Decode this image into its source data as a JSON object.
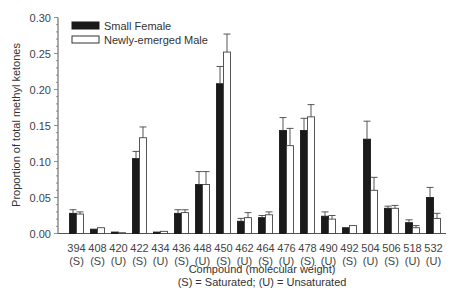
{
  "chart_data": {
    "type": "bar",
    "title": "",
    "xlabel": "Compound (molecular weight)",
    "xlabel_note": "(S) = Saturated; (U) = Unsaturated",
    "ylabel": "Proportion of total methyl ketones",
    "ylim": [
      0,
      0.3
    ],
    "yticks": [
      "0.00",
      "0.05",
      "0.10",
      "0.15",
      "0.20",
      "0.25",
      "0.30"
    ],
    "grid": false,
    "legend_position": "top-left",
    "categories": [
      "394",
      "408",
      "420",
      "422",
      "434",
      "436",
      "448",
      "450",
      "462",
      "464",
      "476",
      "478",
      "490",
      "492",
      "504",
      "506",
      "518",
      "532"
    ],
    "category_types": [
      "(S)",
      "(S)",
      "(U)",
      "(S)",
      "(U)",
      "(S)",
      "(U)",
      "(S)",
      "(U)",
      "(S)",
      "(U)",
      "(S)",
      "(U)",
      "(S)",
      "(U)",
      "(S)",
      "(U)",
      "(U)"
    ],
    "series": [
      {
        "name": "Small Female",
        "fill": "#1a1a1a",
        "values": [
          0.028,
          0.006,
          0.002,
          0.104,
          0.002,
          0.028,
          0.068,
          0.208,
          0.017,
          0.022,
          0.143,
          0.143,
          0.024,
          0.008,
          0.131,
          0.035,
          0.015,
          0.05
        ],
        "errors": [
          0.005,
          0.001,
          0.0,
          0.01,
          0.0,
          0.005,
          0.018,
          0.024,
          0.004,
          0.003,
          0.018,
          0.017,
          0.006,
          0.0,
          0.025,
          0.003,
          0.004,
          0.014
        ]
      },
      {
        "name": "Newly-emerged Male",
        "fill": "#ffffff",
        "values": [
          0.027,
          0.008,
          0.0,
          0.133,
          0.003,
          0.029,
          0.068,
          0.252,
          0.022,
          0.026,
          0.122,
          0.162,
          0.02,
          0.011,
          0.06,
          0.035,
          0.008,
          0.021
        ],
        "errors": [
          0.003,
          0.001,
          0.0,
          0.015,
          0.0,
          0.004,
          0.018,
          0.025,
          0.007,
          0.004,
          0.024,
          0.017,
          0.005,
          0.001,
          0.018,
          0.004,
          0.003,
          0.007
        ]
      }
    ]
  }
}
